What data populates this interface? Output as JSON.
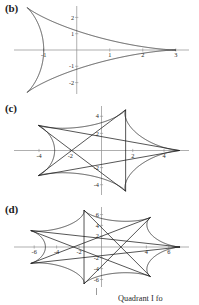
{
  "figure": {
    "background_color": "#ffffff",
    "curve_color": "#1d1d1d",
    "axis_color": "#8c8c8c",
    "caption_fragment": "Quadrant I fo"
  },
  "panels": [
    {
      "label": "(b)",
      "name": "panel-b",
      "chart_data": {
        "type": "line",
        "title": "",
        "xlabel": "",
        "ylabel": "",
        "curve_type": "hypocycloid-deltoid",
        "cusps": 3,
        "radius": 3,
        "rotation_deg": 0,
        "xlim": [
          -1.9,
          3.4
        ],
        "ylim": [
          -2.7,
          2.7
        ],
        "grid": false,
        "legend": null,
        "xticks": [
          -1,
          1,
          2,
          3
        ],
        "xtick_labels": [
          "-1",
          "1",
          "2",
          "3"
        ],
        "yticks": [
          -2,
          -1,
          1,
          2
        ],
        "ytick_labels": [
          "-2",
          "-1",
          "1",
          "2"
        ],
        "parametric": {
          "x": "2*cos(t) + cos(2t)",
          "y": "2*sin(t) - sin(2t)"
        },
        "cusp_points": [
          [
            3,
            0
          ],
          [
            -1.5,
            2.598
          ],
          [
            -1.5,
            -2.598
          ]
        ]
      }
    },
    {
      "label": "(c)",
      "name": "panel-c",
      "chart_data": {
        "type": "line",
        "title": "",
        "xlabel": "",
        "ylabel": "",
        "curve_type": "star-polygon-curve",
        "cusps": 5,
        "radius": 5,
        "rotation_deg": 0,
        "xlim": [
          -5.6,
          5.6
        ],
        "ylim": [
          -5.2,
          5.2
        ],
        "grid": false,
        "legend": null,
        "xticks": [
          -4,
          -2,
          2,
          4
        ],
        "xtick_labels": [
          "-4",
          "-2",
          "2",
          "4"
        ],
        "yticks": [
          -4,
          -2,
          2,
          4
        ],
        "ytick_labels": [
          "-4",
          "-2",
          "2",
          "4"
        ],
        "parametric": {
          "x": "4*cos(t) + cos(4t)",
          "y": "4*sin(t) - sin(4t)"
        },
        "cusp_points": [
          [
            5,
            0
          ],
          [
            1.545,
            4.755
          ],
          [
            -4.045,
            2.939
          ],
          [
            -4.045,
            -2.939
          ],
          [
            1.545,
            -4.755
          ]
        ]
      }
    },
    {
      "label": "(d)",
      "name": "panel-d",
      "chart_data": {
        "type": "line",
        "title": "",
        "xlabel": "",
        "ylabel": "",
        "curve_type": "star-polygon-curve",
        "cusps": 7,
        "radius": 7,
        "rotation_deg": 0,
        "xlim": [
          -7.8,
          7.8
        ],
        "ylim": [
          -7.4,
          7.4
        ],
        "grid": false,
        "legend": null,
        "xticks": [
          -6,
          -4,
          -2,
          4,
          6
        ],
        "xtick_labels": [
          "-6",
          "-4",
          "-2",
          "4",
          "6"
        ],
        "yticks": [
          -6,
          -4,
          -2,
          2,
          4,
          6
        ],
        "ytick_labels": [
          "-6",
          "-4",
          "-2",
          "2",
          "4",
          "6"
        ],
        "parametric": {
          "x": "6*cos(t) + cos(6t)",
          "y": "6*sin(t) - sin(6t)"
        },
        "cusp_points": [
          [
            7,
            0
          ],
          [
            4.365,
            5.472
          ],
          [
            -1.558,
            6.824
          ],
          [
            -6.306,
            3.038
          ],
          [
            -6.306,
            -3.038
          ],
          [
            -1.558,
            -6.824
          ],
          [
            4.365,
            -5.472
          ]
        ]
      }
    }
  ]
}
